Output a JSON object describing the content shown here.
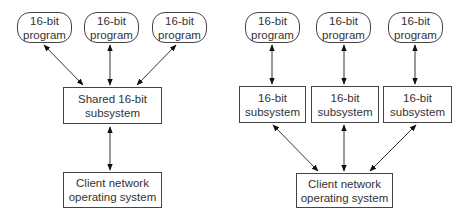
{
  "left_diagram": {
    "programs": [
      {
        "line1": "16-bit",
        "line2": "program"
      },
      {
        "line1": "16-bit",
        "line2": "program"
      },
      {
        "line1": "16-bit",
        "line2": "program"
      }
    ],
    "shared_subsystem": {
      "line1": "Shared 16-bit",
      "line2": "subsystem"
    },
    "client_os": {
      "line1": "Client network",
      "line2": "operating system"
    }
  },
  "right_diagram": {
    "programs": [
      {
        "line1": "16-bit",
        "line2": "program"
      },
      {
        "line1": "16-bit",
        "line2": "program"
      },
      {
        "line1": "16-bit",
        "line2": "program"
      }
    ],
    "subsystems": [
      {
        "line1": "16-bit",
        "line2": "subsystem"
      },
      {
        "line1": "16-bit",
        "line2": "subsystem"
      },
      {
        "line1": "16-bit",
        "line2": "subsystem"
      }
    ],
    "client_os": {
      "line1": "Client network",
      "line2": "operating system"
    }
  },
  "colors": {
    "stroke": "#444444",
    "text": "#333333",
    "background": "#ffffff"
  }
}
